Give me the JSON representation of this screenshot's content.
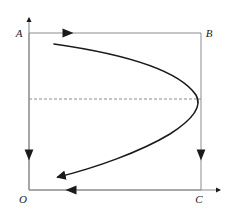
{
  "figure": {
    "title": "",
    "canvas": {
      "width": 233,
      "height": 216,
      "background": "#ffffff"
    },
    "colors": {
      "axis": "#8c8c8c",
      "rectangle": "#8c8c8c",
      "dashed_line": "#8c8c8c",
      "curve": "#1a1a1a",
      "arrow_marker": "#1a1a1a",
      "label_text": "#1a1a1a"
    },
    "labels": {
      "origin": "O",
      "top_left": "A",
      "top_right": "B",
      "bottom_right": "C"
    },
    "axes": {
      "vertical": {
        "name": "vertical-axis",
        "x": 29,
        "y_bottom": 190,
        "y_top": 16,
        "arrow_direction": "up"
      },
      "horizontal": {
        "name": "horizontal-axis",
        "y": 190,
        "x_left": 29,
        "x_right": 222,
        "arrow_direction": "right"
      }
    },
    "rectangle": {
      "name": "boundary-rectangle",
      "left": 29,
      "top": 33,
      "right": 201,
      "bottom": 190,
      "stroke_width": 1
    },
    "edge_direction_arrows": [
      {
        "name": "top-edge-arrow",
        "x": 68,
        "y": 33,
        "direction": "right"
      },
      {
        "name": "bottom-edge-arrow",
        "x": 70,
        "y": 190,
        "direction": "left"
      },
      {
        "name": "left-edge-arrow",
        "x": 29,
        "y": 155,
        "direction": "down"
      },
      {
        "name": "right-edge-arrow",
        "x": 201,
        "y": 155,
        "direction": "down"
      }
    ],
    "dashed_line": {
      "name": "dashed-guide-line",
      "y": 99,
      "x_start": 29,
      "x_end": 201,
      "dash_pattern": "3 2"
    },
    "trajectory_curve": {
      "name": "trajectory-curve",
      "description": "leftward-opening parabolic trajectory with arrowhead at terminal end",
      "start_point": [
        54,
        44
      ],
      "vertex_point": [
        197,
        99
      ],
      "end_point": [
        53,
        178
      ],
      "arrow_at": "end",
      "stroke_width": 1.6,
      "path": "M 54 44 C 110 52, 176 66, 196 95 C 202 105, 195 118, 170 134 C 140 152, 95 168, 57 177"
    }
  }
}
